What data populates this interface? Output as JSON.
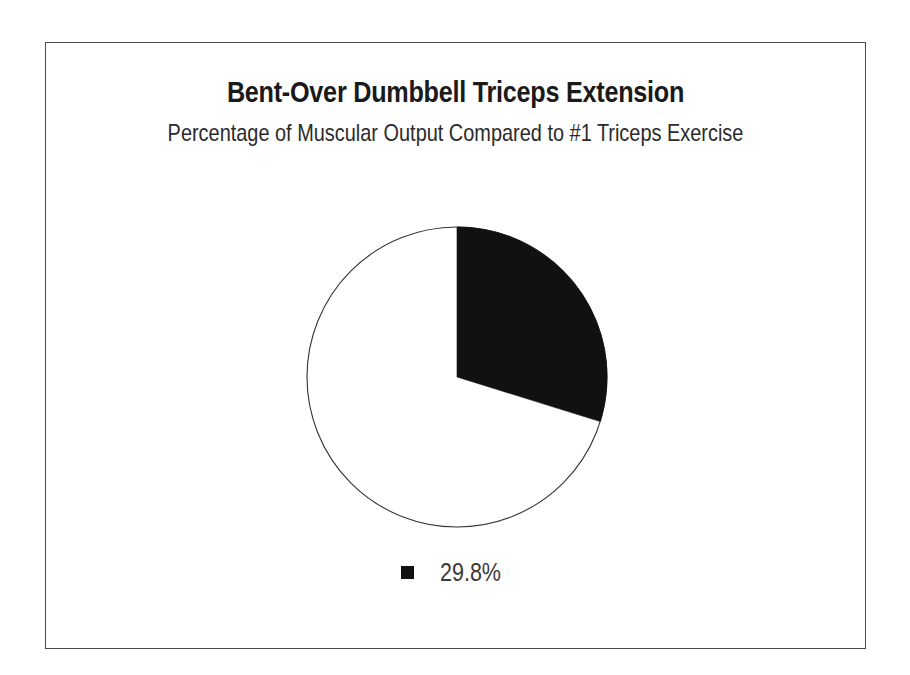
{
  "figure": {
    "title": "Bent-Over Dumbbell Triceps Extension",
    "subtitle": "Percentage of Muscular Output Compared to #1 Triceps Exercise",
    "frame_color": "#4a4a4a",
    "background_color": "#ffffff"
  },
  "legend": {
    "position": "bottom",
    "items": [
      {
        "label": "29.8%",
        "color": "#111111",
        "marker": "filled-square"
      }
    ]
  },
  "chart_data": {
    "type": "pie",
    "title": "Bent-Over Dumbbell Triceps Extension",
    "subtitle": "Percentage of Muscular Output Compared to #1 Triceps Exercise",
    "xlabel": "",
    "ylabel": "",
    "categories": [
      "29.8%",
      "Remainder"
    ],
    "values": [
      29.8,
      70.2
    ],
    "value_labels": [
      "29.8%",
      ""
    ],
    "colors": [
      "#111111",
      "#ffffff"
    ],
    "slice_colors": {
      "filled": "#111111",
      "empty": "#ffffff",
      "outline": "#333333"
    },
    "start_angle_deg": 90,
    "direction": "clockwise",
    "grid": false,
    "legend_entries": [
      "29.8%"
    ],
    "legend_position": "bottom",
    "annotations": []
  }
}
